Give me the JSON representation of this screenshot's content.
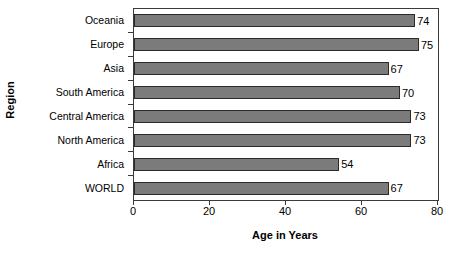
{
  "chart_data": {
    "type": "bar",
    "orientation": "horizontal",
    "title": "",
    "xlabel": "Age in Years",
    "ylabel": "Region",
    "categories": [
      "Oceania",
      "Europe",
      "Asia",
      "South America",
      "Central America",
      "North America",
      "Africa",
      "WORLD"
    ],
    "values": [
      74,
      75,
      67,
      70,
      73,
      73,
      54,
      67
    ],
    "data_labels": [
      "74",
      "75",
      "67",
      "70",
      "73",
      "73",
      "54",
      "67"
    ],
    "xlim": [
      0,
      80
    ],
    "xticks": [
      0,
      20,
      40,
      60,
      80
    ],
    "xtick_labels": [
      "0",
      "20",
      "40",
      "60",
      "80"
    ],
    "grid": false,
    "legend": false,
    "bar_color": "#7b7b7b",
    "bar_border_color": "#2b2b2b",
    "axis_color": "#3a3a3a",
    "background": "#ffffff"
  }
}
